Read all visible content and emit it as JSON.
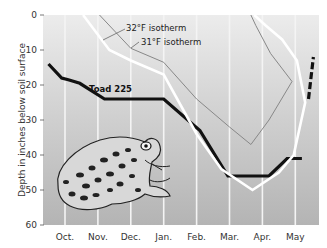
{
  "chart_data": {
    "type": "line",
    "title": "",
    "xlabel": "",
    "ylabel": "Depth in inches below soil surface",
    "ylim": [
      0,
      60
    ],
    "y_inverted": true,
    "yticks": [
      0,
      10,
      20,
      30,
      40,
      50,
      60
    ],
    "categories": [
      "Oct.",
      "Nov.",
      "Dec.",
      "Jan.",
      "Feb.",
      "Mar.",
      "Apr.",
      "May"
    ],
    "grid": "vertical lines at each month",
    "series": [
      {
        "name": "Toad 225",
        "color": "#111111",
        "style": "thick solid, dashed at end",
        "points": [
          [
            -0.5,
            14
          ],
          [
            -0.1,
            18
          ],
          [
            0.1,
            18.5
          ],
          [
            0.45,
            19.5
          ],
          [
            1.2,
            24
          ],
          [
            1.5,
            24
          ],
          [
            3.0,
            24
          ],
          [
            4.1,
            33
          ],
          [
            4.95,
            46
          ],
          [
            6.2,
            46
          ],
          [
            6.75,
            41
          ],
          [
            7.2,
            41
          ],
          [
            7.4,
            24
          ],
          [
            7.55,
            12
          ]
        ]
      },
      {
        "name": "32°F isotherm",
        "color": "#ffffff",
        "style": "solid white",
        "points": [
          [
            0.55,
            0
          ],
          [
            1.35,
            10
          ],
          [
            2.0,
            13
          ],
          [
            3.0,
            17
          ],
          [
            4.0,
            34
          ],
          [
            4.75,
            44
          ],
          [
            5.7,
            50
          ],
          [
            6.5,
            45
          ],
          [
            6.95,
            40
          ],
          [
            7.3,
            25
          ],
          [
            7.05,
            13
          ],
          [
            6.6,
            7
          ],
          [
            6.1,
            3
          ],
          [
            5.75,
            0
          ]
        ]
      },
      {
        "name": "31°F isotherm",
        "color": "#888888",
        "style": "thin grey",
        "points": [
          [
            1.05,
            0
          ],
          [
            2.0,
            9.5
          ],
          [
            3.0,
            13.5
          ],
          [
            4.0,
            24
          ],
          [
            5.0,
            32
          ],
          [
            5.65,
            37
          ],
          [
            6.2,
            30
          ],
          [
            6.9,
            19
          ],
          [
            6.25,
            11
          ],
          [
            5.8,
            3
          ],
          [
            5.65,
            0
          ]
        ]
      }
    ],
    "annotations": [
      {
        "text": "32°F isotherm",
        "near": "upper middle, pointer line to white line"
      },
      {
        "text": "31°F isotherm",
        "near": "upper middle, pointer line to grey line"
      },
      {
        "text": "Toad 225",
        "near": "left-middle above the toad line"
      }
    ],
    "illustration": "drawing of a toad in lower-left of plot"
  },
  "labels": {
    "ylabel": "Depth in inches below soil surface",
    "yticks": [
      "0",
      "10",
      "20",
      "30",
      "40",
      "50",
      "60"
    ],
    "months": [
      "Oct.",
      "Nov.",
      "Dec.",
      "Jan.",
      "Feb.",
      "Mar.",
      "Apr.",
      "May"
    ],
    "isotherm32": "32°F isotherm",
    "isotherm31": "31°F isotherm",
    "toad": "Toad 225"
  }
}
